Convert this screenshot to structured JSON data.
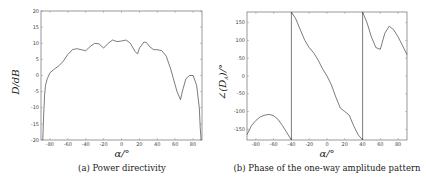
{
  "chart_data": [
    {
      "type": "line",
      "panel": "a",
      "caption": "(a) Power directivity",
      "xlabel": "α/°",
      "ylabel": "D/dB",
      "xlim": [
        -90,
        90
      ],
      "ylim": [
        -20,
        20
      ],
      "xticks": [
        -80,
        -60,
        -40,
        -20,
        0,
        20,
        40,
        60,
        80
      ],
      "yticks": [
        -20,
        -15,
        -10,
        -5,
        0,
        5,
        10,
        15,
        20
      ],
      "grid": false,
      "series": [
        {
          "name": "D",
          "x": [
            -88,
            -87,
            -86,
            -85,
            -83,
            -80,
            -75,
            -70,
            -65,
            -60,
            -55,
            -50,
            -45,
            -40,
            -35,
            -30,
            -25,
            -20,
            -15,
            -10,
            -5,
            0,
            5,
            10,
            15,
            18,
            20,
            25,
            28,
            32,
            36,
            40,
            45,
            50,
            55,
            58,
            62,
            66,
            68,
            72,
            76,
            80,
            84,
            87,
            88,
            89
          ],
          "y": [
            -20,
            -12,
            -6,
            -3,
            -1,
            0.8,
            2,
            3,
            4.5,
            6.5,
            8,
            8.3,
            8,
            7.7,
            9,
            10,
            9.8,
            8.5,
            10,
            11,
            10.5,
            10.7,
            11,
            10,
            7.5,
            6.7,
            8.5,
            10.4,
            10.2,
            8.8,
            8,
            8,
            7.7,
            6,
            2,
            -1,
            -5,
            -7.5,
            -5,
            -1,
            0,
            0,
            -3,
            -10,
            -16,
            -20
          ]
        }
      ]
    },
    {
      "type": "line",
      "panel": "b",
      "caption": "(b) Phase of the one-way amplitude pattern",
      "xlabel": "α/°",
      "ylabel": "∠(D_A)/°",
      "xlim": [
        -90,
        90
      ],
      "ylim": [
        -180,
        180
      ],
      "xticks": [
        -80,
        -60,
        -40,
        -20,
        0,
        20,
        40,
        60,
        80
      ],
      "yticks": [
        -150,
        -100,
        -50,
        0,
        50,
        100,
        150
      ],
      "grid": false,
      "series": [
        {
          "name": "phase",
          "x": [
            -90,
            -85,
            -80,
            -75,
            -70,
            -65,
            -60,
            -55,
            -50,
            -45,
            -40,
            -40,
            -35,
            -30,
            -25,
            -20,
            -15,
            -10,
            -5,
            0,
            5,
            10,
            15,
            20,
            25,
            30,
            35,
            40,
            40,
            45,
            50,
            55,
            60,
            65,
            70,
            75,
            80,
            85,
            90
          ],
          "y": [
            -165,
            -140,
            -125,
            -115,
            -110,
            -108,
            -112,
            -122,
            -140,
            -160,
            -180,
            180,
            160,
            130,
            100,
            80,
            65,
            45,
            20,
            0,
            -25,
            -60,
            -90,
            -100,
            -110,
            -140,
            -165,
            -180,
            180,
            150,
            110,
            80,
            75,
            120,
            140,
            130,
            110,
            85,
            60
          ]
        }
      ]
    }
  ],
  "panels": {
    "a": {
      "caption": "(a) Power directivity",
      "ylabel": "D/dB",
      "xlabel": "α/°",
      "xtick_labels": [
        "-80",
        "-60",
        "-40",
        "-20",
        "0",
        "20",
        "40",
        "60",
        "80"
      ],
      "ytick_labels": [
        "20",
        "15",
        "10",
        "5",
        "0",
        "-5",
        "-10",
        "-15",
        "-20"
      ]
    },
    "b": {
      "caption": "(b) Phase of the one-way amplitude pattern",
      "ylabel": "∠(D",
      "ylabel_sub": "A",
      "ylabel_tail": ")/°",
      "xlabel": "α/°",
      "xtick_labels": [
        "-80",
        "-60",
        "-40",
        "-20",
        "0",
        "20",
        "40",
        "60",
        "80"
      ],
      "ytick_labels": [
        "150",
        "100",
        "50",
        "0",
        "-50",
        "-100",
        "-150"
      ]
    }
  }
}
